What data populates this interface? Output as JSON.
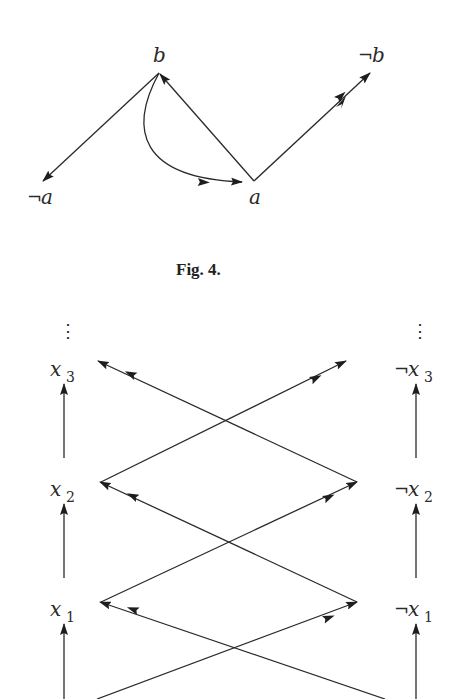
{
  "figure4": {
    "caption": "Fig. 4.",
    "nodes": {
      "b": {
        "label": "b",
        "neg": false
      },
      "not_b": {
        "label": "b",
        "neg": true
      },
      "not_a": {
        "label": "a",
        "neg": true
      },
      "a": {
        "label": "a",
        "neg": false
      }
    },
    "edges": [
      {
        "from": "b",
        "to": "not_a",
        "style": "straight"
      },
      {
        "from": "a",
        "to": "b",
        "style": "straight"
      },
      {
        "from": "a",
        "to": "not_b",
        "style": "straight",
        "double_head": true
      },
      {
        "from": "b",
        "to": "a",
        "style": "curved",
        "double_head": true
      }
    ]
  },
  "figure5": {
    "ellipsis": "⋮",
    "left_column": [
      {
        "var": "x",
        "sub": "3",
        "neg": false
      },
      {
        "var": "x",
        "sub": "2",
        "neg": false
      },
      {
        "var": "x",
        "sub": "1",
        "neg": false
      }
    ],
    "right_column": [
      {
        "var": "x",
        "sub": "3",
        "neg": true
      },
      {
        "var": "x",
        "sub": "2",
        "neg": true
      },
      {
        "var": "x",
        "sub": "1",
        "neg": true
      }
    ],
    "neg_symbol": "¬",
    "edges": [
      {
        "from": "x1",
        "to": "x2",
        "style": "vertical"
      },
      {
        "from": "x2",
        "to": "x3",
        "style": "vertical"
      },
      {
        "from": "¬x1",
        "to": "¬x2",
        "style": "vertical"
      },
      {
        "from": "¬x2",
        "to": "¬x3",
        "style": "vertical"
      },
      {
        "from": "x2",
        "to": "¬x3",
        "style": "diagonal",
        "double_head": true
      },
      {
        "from": "¬x2",
        "to": "x3",
        "style": "diagonal",
        "double_head": true
      },
      {
        "from": "x1",
        "to": "¬x2",
        "style": "diagonal",
        "double_head": true
      },
      {
        "from": "¬x1",
        "to": "x2",
        "style": "diagonal",
        "double_head": true
      },
      {
        "from": "below-left",
        "to": "¬x1",
        "style": "diagonal",
        "double_head": true
      },
      {
        "from": "below-right",
        "to": "x1",
        "style": "diagonal",
        "double_head": true
      }
    ]
  }
}
